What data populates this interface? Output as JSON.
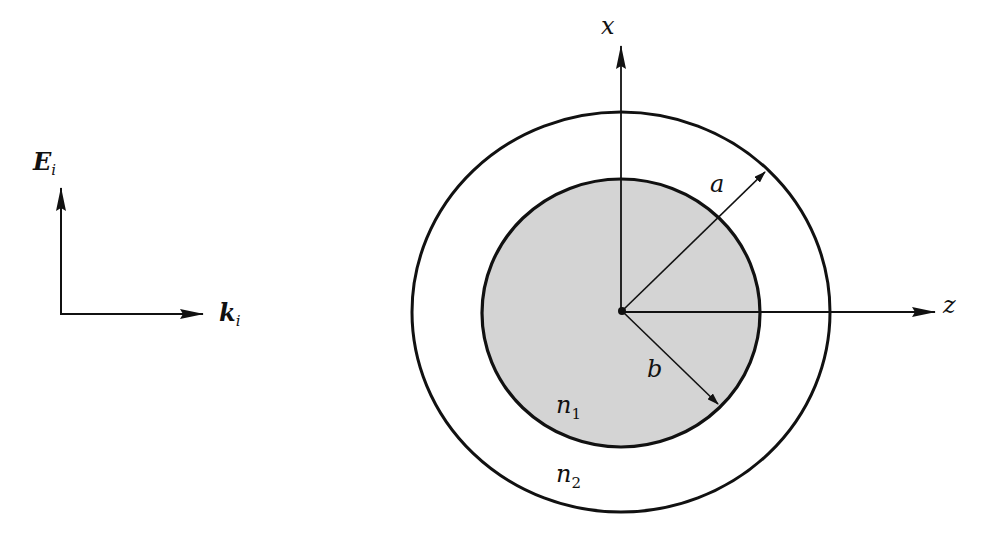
{
  "diagram": {
    "incident_wave": {
      "field_label": "E",
      "field_subscript": "i",
      "wavevector_label": "k",
      "wavevector_subscript": "i"
    },
    "axes": {
      "vertical_label": "x",
      "horizontal_label": "z"
    },
    "radii": {
      "outer_label": "a",
      "inner_label": "b"
    },
    "media": {
      "core_label": "n",
      "core_subscript": "1",
      "shell_label": "n",
      "shell_subscript": "2"
    },
    "colors": {
      "line": "#111111",
      "core_fill": "#d4d4d4",
      "background": "#ffffff"
    }
  }
}
